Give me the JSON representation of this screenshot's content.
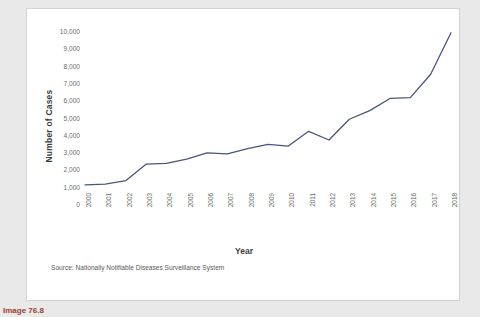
{
  "figure": {
    "caption": "Image 76.8",
    "source_note": "Source: Nationally Notifiable Diseases Surveillance System"
  },
  "chart_data": {
    "type": "line",
    "title": "",
    "xlabel": "Year",
    "ylabel": "Number of Cases",
    "categories": [
      "2000",
      "2001",
      "2002",
      "2003",
      "2004",
      "2005",
      "2006",
      "2007",
      "2008",
      "2009",
      "2010",
      "2011",
      "2012",
      "2013",
      "2014",
      "2015",
      "2016",
      "2017",
      "2018"
    ],
    "values": [
      1100,
      1150,
      1350,
      2300,
      2350,
      2600,
      2950,
      2900,
      3200,
      3450,
      3350,
      4200,
      3700,
      4900,
      5400,
      6100,
      6150,
      7500,
      9900
    ],
    "series": [
      {
        "name": "Number of Cases",
        "values": [
          1100,
          1150,
          1350,
          2300,
          2350,
          2600,
          2950,
          2900,
          3200,
          3450,
          3350,
          4200,
          3700,
          4900,
          5400,
          6100,
          6150,
          7500,
          9900
        ]
      }
    ],
    "ylim": [
      0,
      10000
    ],
    "ytick_values": [
      0,
      1000,
      2000,
      3000,
      4000,
      5000,
      6000,
      7000,
      8000,
      9000,
      10000
    ],
    "ytick_labels": [
      "0",
      "1,000",
      "2,000",
      "3,000",
      "4,000",
      "5,000",
      "6,000",
      "7,000",
      "8,000",
      "9,000",
      "10,000"
    ],
    "grid": false,
    "legend": "none",
    "line_color": "#4a5578",
    "background_color": "#ffffff"
  }
}
